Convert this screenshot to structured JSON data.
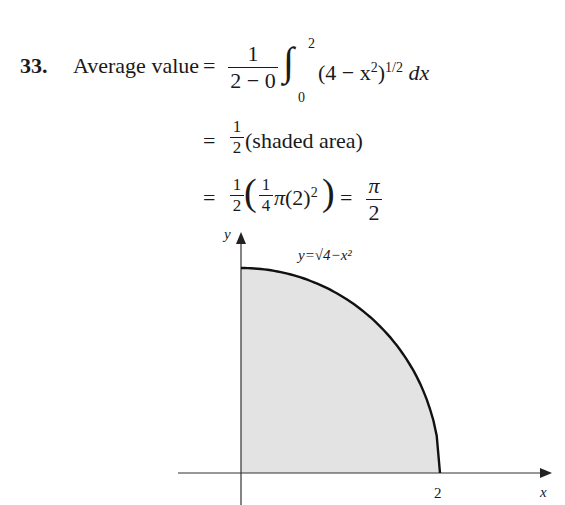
{
  "problem": {
    "number": "33.",
    "lhs": "Average value",
    "line1": {
      "eq": "=",
      "frac_num": "1",
      "frac_den": "2 − 0",
      "integral": "∫",
      "upper": "2",
      "lower": "0",
      "integrand": "(4 − x",
      "sq": "2",
      "close": ")",
      "pow": "1/2",
      "dx": "dx"
    },
    "line2": {
      "eq": "=",
      "frac_num": "1",
      "frac_den": "2",
      "text": "(shaded area)"
    },
    "line3": {
      "eq": "=",
      "frac_num": "1",
      "frac_den": "2",
      "inner_num": "1",
      "inner_den": "4",
      "pi": "π",
      "inner": "(2)",
      "sq": "2",
      "eq2": "=",
      "res_num": "π",
      "res_den": "2"
    }
  },
  "figure": {
    "y_axis_label": "y",
    "x_axis_label": "x",
    "x_tick_label": "2",
    "curve_label": "y=√4−x²",
    "shade_color": "#e3e3e3",
    "curve": {
      "type": "quarter-circle",
      "radius": 2,
      "x_range": [
        0,
        2
      ]
    }
  }
}
